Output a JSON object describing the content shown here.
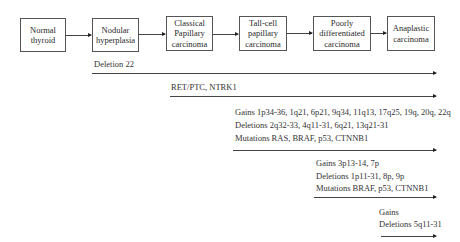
{
  "stages": [
    {
      "label": "Normal\nthyroid"
    },
    {
      "label": "Nodular\nhyperplasia"
    },
    {
      "label": "Classical\nPapillary\ncarcinoma"
    },
    {
      "label": "Tall-cell\npapillary\ncarcinoma"
    },
    {
      "label": "Poorly\ndifferentiated\ncarcinoma"
    },
    {
      "label": "Anaplastic\ncarcinoma"
    }
  ],
  "alterations": [
    {
      "lines": [
        "Deletion 22"
      ]
    },
    {
      "lines": [
        "RET/PTC, NTRK1"
      ]
    },
    {
      "lines": [
        "Gains 1p34-36, 1q21, 6p21, 9q34, 11q13,  17q25, 19q, 20q, 22q",
        "Deletions 2q32-33, 4q11-31, 6q21, 13q21-31",
        "Mutations RAS, BRAF, p53, CTNNB1"
      ]
    },
    {
      "lines": [
        "Gains 3p13-14, 7p",
        "Deletions 1p11-31, 8p, 9p",
        "Mutations BRAF, p53, CTNNB1"
      ]
    },
    {
      "lines": [
        "Gains",
        "Deletions 5q11-31"
      ]
    }
  ]
}
